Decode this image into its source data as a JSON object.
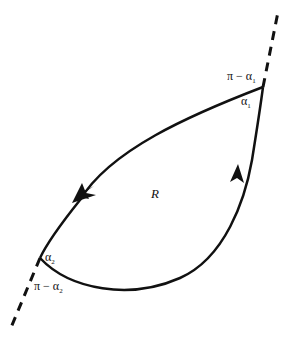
{
  "diagram": {
    "type": "closed contour region with corner angles",
    "region_label": "R",
    "stroke_color": "#111111",
    "background": "#ffffff",
    "vertices": [
      {
        "id": "v1",
        "x": 263,
        "y": 87,
        "interior_angle": "α",
        "interior_sub": "1",
        "exterior_angle": "π − α",
        "exterior_sub": "1"
      },
      {
        "id": "v2",
        "x": 40,
        "y": 258,
        "interior_angle": "α",
        "interior_sub": "2",
        "exterior_angle": "π − α",
        "exterior_sub": "2"
      }
    ],
    "arrows": [
      {
        "on": "upper-left arc",
        "direction": "toward lower-left vertex"
      },
      {
        "on": "lower-right arc",
        "direction": "toward upper-right vertex"
      }
    ],
    "tangent_line": "dashed straight line through both vertices"
  }
}
